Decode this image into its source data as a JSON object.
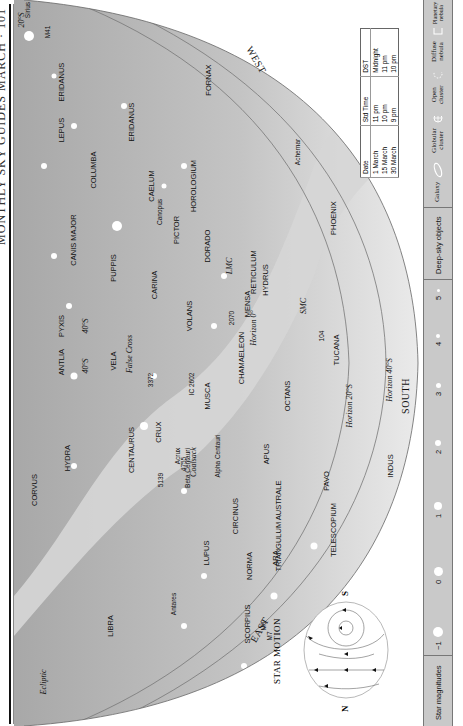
{
  "header": {
    "title": "MONTHLY SKY GUIDES MARCH · 101"
  },
  "map": {
    "directions": {
      "west": "WEST",
      "east": "EAST",
      "south": "SOUTH"
    },
    "horizons": [
      {
        "label": "Horizon 0°"
      },
      {
        "label": "Horizon 20°S"
      },
      {
        "label": "Horizon 40°S"
      }
    ],
    "declination_marks": [
      "20°S",
      "40°S",
      "40°S"
    ],
    "ecliptic": "Ecliptic",
    "constellations": [
      "ERIDANUS",
      "ERIDANUS",
      "FORNAX",
      "LEPUS",
      "COLUMBA",
      "CAELUM",
      "HOROLOGIUM",
      "CANIS MAJOR",
      "PUPPIS",
      "PICTOR",
      "DORADO",
      "CARINA",
      "VOLANS",
      "RETICULUM",
      "MENSA",
      "HYDRUS",
      "PHOENIX",
      "TUCANA",
      "PYXIS",
      "ANTLIA",
      "VELA",
      "CHAMAELEON",
      "MUSCA",
      "OCTANS",
      "CRUX",
      "APUS",
      "PAVO",
      "INDUS",
      "HYDRA",
      "CENTAURUS",
      "CIRCINUS",
      "TRIANGULUM AUSTRALE",
      "CORVUS",
      "LUPUS",
      "NORMA",
      "ARA",
      "TELESCOPIUM",
      "LIBRA",
      "SCORPIUS"
    ],
    "stars": [
      "Sirius",
      "Canopus",
      "Achernar",
      "Acrux",
      "Alpha Centauri",
      "Beta Centauri",
      "Antares"
    ],
    "deep_sky": [
      "M41",
      "2070",
      "LMC",
      "SMC",
      "104",
      "3372",
      "IC 2602",
      "4755",
      "5139",
      "M6",
      "M7"
    ],
    "asterisms": [
      "False Cross",
      "Coalsack"
    ]
  },
  "time_table": {
    "headers": [
      "Date",
      "Std Time",
      "DST"
    ],
    "rows": [
      [
        "1 March",
        "11 pm",
        "Midnight"
      ],
      [
        "15 March",
        "10 pm",
        "11 pm"
      ],
      [
        "30 March",
        "9 pm",
        "10 pm"
      ]
    ]
  },
  "star_motion": {
    "title": "STAR MOTION",
    "north": "N",
    "south": "S"
  },
  "legend": {
    "magnitudes_label": "Star magnitudes",
    "magnitudes": [
      "−1",
      "0",
      "1",
      "2",
      "3",
      "4",
      "5"
    ],
    "deep_sky_label": "Deep-sky objects",
    "types": [
      {
        "label": "Galaxy",
        "icon": "galaxy-icon"
      },
      {
        "label": "Globular cluster",
        "icon": "globular-cluster-icon"
      },
      {
        "label": "Open cluster",
        "icon": "open-cluster-icon"
      },
      {
        "label": "Diffuse nebula",
        "icon": "diffuse-nebula-icon"
      },
      {
        "label": "Planetary nebula",
        "icon": "planetary-nebula-icon"
      }
    ]
  }
}
